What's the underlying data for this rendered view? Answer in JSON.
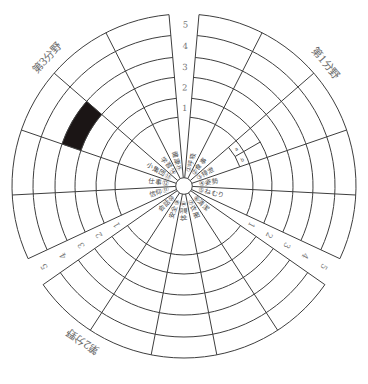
{
  "chart_data": {
    "type": "heatmap",
    "layout": "polar",
    "title": "",
    "xlabel": "",
    "ylabel": "",
    "radial_ticks": [
      "1",
      "2",
      "3",
      "4",
      "5"
    ],
    "radial_range": [
      0,
      5
    ],
    "grid": true,
    "legend": null,
    "sectors": [
      {
        "name": "第1分野",
        "items": [
          {
            "num": "①",
            "label": "呼吸",
            "value": null
          },
          {
            "num": "②",
            "label": "食事",
            "value": null
          },
          {
            "num": "③",
            "label": "排泄",
            "value": null,
            "sub": [
              "a",
              "b"
            ]
          },
          {
            "num": "④",
            "label": "姿勢",
            "value": null
          },
          {
            "num": "⑤",
            "label": "ねむり",
            "value": null
          }
        ]
      },
      {
        "name": "第2分野",
        "items": [
          {
            "num": "⑥",
            "label": "清潔",
            "value": null
          },
          {
            "num": "⑦",
            "label": "衣服",
            "value": null
          },
          {
            "num": "⑧",
            "label": "体温",
            "value": null
          },
          {
            "num": "⑨",
            "label": "安全",
            "value": null
          },
          {
            "num": "⑩",
            "label": "会話",
            "value": null
          }
        ]
      },
      {
        "name": "第3分野",
        "items": [
          {
            "num": "⑪",
            "label": "信仰",
            "value": null
          },
          {
            "num": "⑫",
            "label": "仕事",
            "value": null
          },
          {
            "num": "⑬",
            "label": "小集団",
            "value": 3,
            "filled_levels": [
              3
            ]
          },
          {
            "num": "⑭",
            "label": "学習",
            "value": null
          },
          {
            "num": "⑮",
            "label": "健康",
            "value": null
          }
        ]
      }
    ],
    "colors": {
      "grid": "#3e3e3e",
      "filled": "#1b1515",
      "text": "#4a4a4a"
    }
  }
}
